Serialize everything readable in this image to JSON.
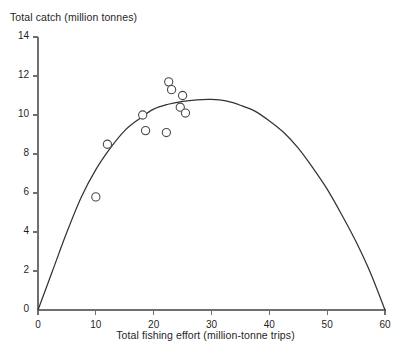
{
  "chart_data": {
    "type": "scatter",
    "title": "",
    "xlabel": "Total fishing effort (million-tonne trips)",
    "ylabel": "Total catch (million tonnes)",
    "xlim": [
      0,
      60
    ],
    "ylim": [
      0,
      14
    ],
    "xticks": [
      0,
      10,
      20,
      30,
      40,
      50,
      60
    ],
    "yticks": [
      0,
      2,
      4,
      6,
      8,
      10,
      12,
      14
    ],
    "xtick_labels": [
      "0",
      "10",
      "20",
      "30",
      "40",
      "50",
      "60"
    ],
    "ytick_labels": [
      "0",
      "2",
      "4",
      "6",
      "8",
      "10",
      "12",
      "14"
    ],
    "grid": false,
    "legend": null,
    "series": [
      {
        "name": "Observed catch",
        "type": "scatter",
        "marker": "open-circle",
        "points": [
          {
            "x": 10.0,
            "y": 5.8
          },
          {
            "x": 12.0,
            "y": 8.5
          },
          {
            "x": 18.1,
            "y": 10.0
          },
          {
            "x": 18.6,
            "y": 9.2
          },
          {
            "x": 22.6,
            "y": 11.7
          },
          {
            "x": 23.1,
            "y": 11.3
          },
          {
            "x": 22.2,
            "y": 9.1
          },
          {
            "x": 25.0,
            "y": 11.0
          },
          {
            "x": 24.6,
            "y": 10.4
          },
          {
            "x": 25.5,
            "y": 10.1
          }
        ]
      },
      {
        "name": "Fitted yield curve",
        "type": "line",
        "points": [
          {
            "x": 0.0,
            "y": 0.0
          },
          {
            "x": 2.5,
            "y": 2.0
          },
          {
            "x": 5.0,
            "y": 4.0
          },
          {
            "x": 7.5,
            "y": 5.8
          },
          {
            "x": 10.0,
            "y": 7.2
          },
          {
            "x": 12.5,
            "y": 8.3
          },
          {
            "x": 15.0,
            "y": 9.2
          },
          {
            "x": 17.5,
            "y": 9.8
          },
          {
            "x": 20.0,
            "y": 10.3
          },
          {
            "x": 22.5,
            "y": 10.55
          },
          {
            "x": 25.0,
            "y": 10.7
          },
          {
            "x": 27.5,
            "y": 10.78
          },
          {
            "x": 30.0,
            "y": 10.8
          },
          {
            "x": 32.5,
            "y": 10.72
          },
          {
            "x": 35.0,
            "y": 10.5
          },
          {
            "x": 37.5,
            "y": 10.2
          },
          {
            "x": 40.0,
            "y": 9.7
          },
          {
            "x": 42.5,
            "y": 9.1
          },
          {
            "x": 45.0,
            "y": 8.3
          },
          {
            "x": 47.5,
            "y": 7.3
          },
          {
            "x": 50.0,
            "y": 6.2
          },
          {
            "x": 52.5,
            "y": 4.9
          },
          {
            "x": 55.0,
            "y": 3.5
          },
          {
            "x": 57.5,
            "y": 1.9
          },
          {
            "x": 60.0,
            "y": 0.0
          }
        ]
      }
    ],
    "colors": {
      "axis": "#6f6f6f",
      "curve": "#333333",
      "marker_stroke": "#4a4a4a",
      "marker_fill": "#ffffff",
      "text": "#1f1f1f",
      "background": "#ffffff"
    }
  },
  "geometry": {
    "x0_px": 38,
    "y0_px": 310,
    "x_per_unit_px": 5.783,
    "y_per_unit_px": 19.5,
    "tick_len_px": 5,
    "marker_radius_px": 4.1
  }
}
